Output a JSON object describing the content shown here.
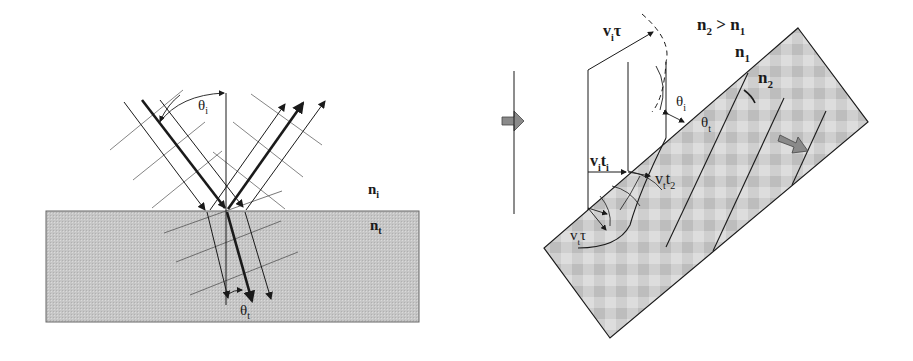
{
  "left_figure": {
    "title": "Reflection and refraction at a planar interface",
    "labels": {
      "theta_i": "θ",
      "theta_i_sub": "i",
      "theta_t": "θ",
      "theta_t_sub": "t",
      "n_i": "n",
      "n_i_sub": "i",
      "n_t": "n",
      "n_t_sub": "t"
    }
  },
  "right_figure": {
    "title": "Huygens construction of refraction at a tilted interface",
    "labels": {
      "condition": "n",
      "condition_sub2": "2",
      "condition_gt": " > n",
      "condition_sub1": "1",
      "n1": "n",
      "n1_sub": "1",
      "n2": "n",
      "n2_sub": "2",
      "vi_tau": "v",
      "vi_tau_sub": "i",
      "vi_tau_end": "τ",
      "vi_ti": "v",
      "vi_ti_sub": "i",
      "vi_ti_mid": "t",
      "vi_ti_sub2": "i",
      "vt_t2": "v",
      "vt_t2_sub": "t",
      "vt_t2_mid": "t",
      "vt_t2_sub2": "2",
      "vt_tau": "v",
      "vt_tau_sub": "t",
      "vt_tau_end": "τ",
      "theta_i": "θ",
      "theta_i_sub": "i",
      "theta_t": "θ",
      "theta_t_sub": "t"
    }
  },
  "colors": {
    "medium_fill": "#c4c4c4",
    "medium_pattern_light": "#d8d8d8",
    "line": "#1a1a1a",
    "thin_line": "#555555",
    "arrow_fill": "#8a8a8a"
  }
}
